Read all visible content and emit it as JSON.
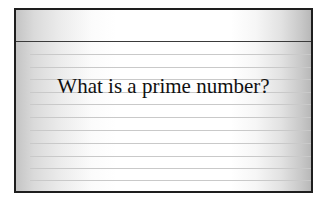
{
  "card": {
    "question": "What is a prime number?",
    "border_color": "#1e1e1e",
    "header_rule_color": "#3a3a3a",
    "rule_color": "#c9c9c9",
    "rule_lines_count": 10
  }
}
